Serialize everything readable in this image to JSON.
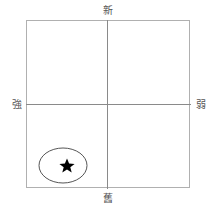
{
  "diagram": {
    "type": "quadrant",
    "axes": {
      "top": "新",
      "bottom": "舊",
      "left": "強",
      "right": "弱"
    },
    "highlight": {
      "shape": "ellipse",
      "quadrant": "bottom-left",
      "marker": "star-icon"
    },
    "colors": {
      "frame": "#b0b0b0",
      "axis": "#8a8a8a",
      "ellipse_stroke": "#555555",
      "star": "#000000"
    }
  }
}
